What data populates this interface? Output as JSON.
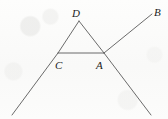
{
  "figure": {
    "background_color": "#fbfbfa",
    "stroke_color": "#5a5a5a",
    "label_color": "#1c1c1c",
    "canvas": {
      "width": 168,
      "height": 119
    },
    "labels": {
      "d": "D",
      "b": "B",
      "c": "C",
      "a": "A"
    },
    "label_positions": {
      "d": {
        "x": 72,
        "y": 8
      },
      "b": {
        "x": 154,
        "y": 7
      },
      "c": {
        "x": 55,
        "y": 60
      },
      "a": {
        "x": 96,
        "y": 60
      }
    },
    "points": {
      "D": {
        "x": 79,
        "y": 21
      },
      "C": {
        "x": 58,
        "y": 53
      },
      "A": {
        "x": 104,
        "y": 53
      },
      "B": {
        "x": 152,
        "y": 14
      },
      "left_ray_end": {
        "x": 12,
        "y": 115
      },
      "right_ray_end": {
        "x": 151,
        "y": 115
      }
    },
    "segments": [
      {
        "name": "ray-left-through-C-to-D",
        "from": "left_ray_end",
        "to": "D"
      },
      {
        "name": "ray-A-to-B",
        "from": "right_ray_end",
        "to": "B"
      },
      {
        "name": "segment-C-to-A",
        "from": "C",
        "to": "A"
      },
      {
        "name": "segment-D-to-A",
        "from": "D",
        "to": "A"
      }
    ]
  }
}
